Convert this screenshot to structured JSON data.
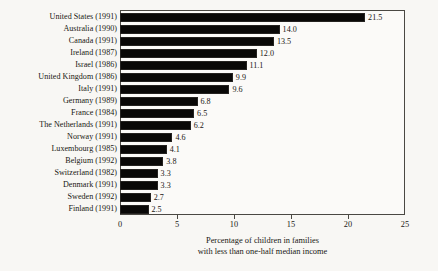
{
  "chart_data": {
    "type": "bar",
    "orientation": "horizontal",
    "title": "",
    "xlabel": "Percentage of children in families with less than one-half median income",
    "ylabel": "",
    "xlim": [
      0,
      25
    ],
    "xticks": [
      0,
      5,
      10,
      15,
      20,
      25
    ],
    "grid": false,
    "legend": false,
    "categories": [
      "United States (1991)",
      "Australia (1990)",
      "Canada (1991)",
      "Ireland (1987)",
      "Israel (1986)",
      "United Kingdom (1986)",
      "Italy (1991)",
      "Germany (1989)",
      "France (1984)",
      "The Netherlands (1991)",
      "Norway (1991)",
      "Luxembourg (1985)",
      "Belgium (1992)",
      "Switzerland (1982)",
      "Denmark (1991)",
      "Sweden (1992)",
      "Finland (1991)"
    ],
    "values": [
      21.5,
      14.0,
      13.5,
      12.0,
      11.1,
      9.9,
      9.6,
      6.8,
      6.5,
      6.2,
      4.6,
      4.1,
      3.8,
      3.3,
      3.3,
      2.7,
      2.5
    ],
    "value_labels": [
      "21.5",
      "14.0",
      "13.5",
      "12.0",
      "11.1",
      "9.9",
      "9.6",
      "6.8",
      "6.5",
      "6.2",
      "4.6",
      "4.1",
      "3.8",
      "3.3",
      "3.3",
      "2.7",
      "2.5"
    ],
    "bar_color": "#090807",
    "frame_color": "#4a4843",
    "background_color": "#f8f7f4"
  },
  "axis": {
    "tick_labels": [
      "0",
      "5",
      "10",
      "15",
      "20",
      "25"
    ]
  },
  "caption": {
    "line1": "Percentage of children in families",
    "line2": "with less than one-half median income"
  }
}
